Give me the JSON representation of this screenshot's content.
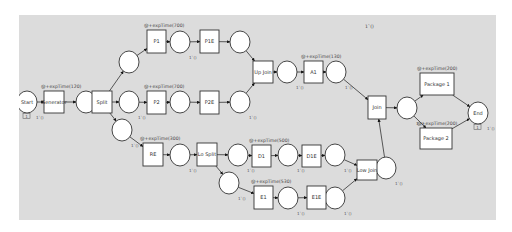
{
  "diagram": {
    "type": "petri-net",
    "canvas_color": "#dcdcdc",
    "top_marker": "1`()",
    "places": [
      {
        "id": "start",
        "label": "Start",
        "x": 27,
        "y": 102,
        "marking": "1`()",
        "token_count": "1"
      },
      {
        "id": "p_gen",
        "label": "",
        "x": 86,
        "y": 102,
        "marking": ""
      },
      {
        "id": "p_split_up",
        "label": "",
        "x": 129,
        "y": 62,
        "marking": ""
      },
      {
        "id": "p_split_mid",
        "label": "",
        "x": 129,
        "y": 102,
        "marking": "1`()"
      },
      {
        "id": "p_split_lo",
        "label": "",
        "x": 122,
        "y": 130,
        "marking": "1`()"
      },
      {
        "id": "p_p1",
        "label": "",
        "x": 180,
        "y": 42,
        "marking": "1`()"
      },
      {
        "id": "p_p1e",
        "label": "",
        "x": 240,
        "y": 42,
        "marking": ""
      },
      {
        "id": "p_p2",
        "label": "",
        "x": 180,
        "y": 102,
        "marking": ""
      },
      {
        "id": "p_p2e",
        "label": "",
        "x": 240,
        "y": 102,
        "marking": "1`()"
      },
      {
        "id": "p_upjoin",
        "label": "",
        "x": 287,
        "y": 72,
        "marking": "1`()"
      },
      {
        "id": "p_a1",
        "label": "",
        "x": 336,
        "y": 72,
        "marking": "1`()"
      },
      {
        "id": "p_re",
        "label": "",
        "x": 180,
        "y": 155,
        "marking": "1`()"
      },
      {
        "id": "p_losplit_up",
        "label": "",
        "x": 238,
        "y": 155,
        "marking": "1`()"
      },
      {
        "id": "p_losplit_lo",
        "label": "",
        "x": 229,
        "y": 183,
        "marking": "1`()"
      },
      {
        "id": "p_d1",
        "label": "",
        "x": 288,
        "y": 155,
        "marking": "1`()"
      },
      {
        "id": "p_d1e",
        "label": "",
        "x": 335,
        "y": 155,
        "marking": "1`()"
      },
      {
        "id": "p_e1",
        "label": "",
        "x": 288,
        "y": 198,
        "marking": "1`()"
      },
      {
        "id": "p_e1e",
        "label": "",
        "x": 335,
        "y": 198,
        "marking": "1`()"
      },
      {
        "id": "p_lojoin",
        "label": "",
        "x": 386,
        "y": 168,
        "marking": "1`()"
      },
      {
        "id": "p_join",
        "label": "",
        "x": 407,
        "y": 108,
        "marking": "1`()"
      },
      {
        "id": "end",
        "label": "End",
        "x": 478,
        "y": 113,
        "marking": "1`()",
        "token_count": "1"
      }
    ],
    "transitions": [
      {
        "id": "t_generator",
        "label": "Generator",
        "x": 44,
        "y": 91,
        "w": 20,
        "h": 22,
        "annotation": "@+expTime(120)"
      },
      {
        "id": "t_split",
        "label": "Split",
        "x": 92,
        "y": 91,
        "w": 20,
        "h": 22,
        "annotation": ""
      },
      {
        "id": "t_p1",
        "label": "P1",
        "x": 147,
        "y": 30,
        "w": 19,
        "h": 23,
        "annotation": "@+expTime(700)"
      },
      {
        "id": "t_p1e",
        "label": "P1E",
        "x": 200,
        "y": 30,
        "w": 19,
        "h": 23,
        "annotation": ""
      },
      {
        "id": "t_p2",
        "label": "P2",
        "x": 147,
        "y": 91,
        "w": 19,
        "h": 23,
        "annotation": "@+expTime(700)"
      },
      {
        "id": "t_p2e",
        "label": "P2E",
        "x": 200,
        "y": 91,
        "w": 19,
        "h": 23,
        "annotation": ""
      },
      {
        "id": "t_upjoin",
        "label": "Up Join",
        "x": 253,
        "y": 61,
        "w": 20,
        "h": 22,
        "annotation": ""
      },
      {
        "id": "t_a1",
        "label": "A1",
        "x": 304,
        "y": 61,
        "w": 19,
        "h": 22,
        "annotation": "@+expTime(130)"
      },
      {
        "id": "t_re",
        "label": "RE",
        "x": 143,
        "y": 143,
        "w": 20,
        "h": 23,
        "annotation": "@+expTime(300)"
      },
      {
        "id": "t_losplit",
        "label": "Lo Split",
        "x": 197,
        "y": 143,
        "w": 20,
        "h": 23,
        "annotation": ""
      },
      {
        "id": "t_d1",
        "label": "D1",
        "x": 252,
        "y": 145,
        "w": 19,
        "h": 22,
        "annotation": "@+expTime(500)"
      },
      {
        "id": "t_d1e",
        "label": "D1E",
        "x": 302,
        "y": 145,
        "w": 19,
        "h": 22,
        "annotation": ""
      },
      {
        "id": "t_e1",
        "label": "E1",
        "x": 254,
        "y": 186,
        "w": 19,
        "h": 23,
        "annotation": "@+expTime(530)"
      },
      {
        "id": "t_e1e",
        "label": "E1E",
        "x": 307,
        "y": 186,
        "w": 19,
        "h": 23,
        "annotation": ""
      },
      {
        "id": "t_lowjoin",
        "label": "Low Join",
        "x": 357,
        "y": 160,
        "w": 20,
        "h": 20,
        "annotation": ""
      },
      {
        "id": "t_join",
        "label": "Join",
        "x": 368,
        "y": 96,
        "w": 18,
        "h": 23,
        "annotation": ""
      },
      {
        "id": "t_package1",
        "label": "Package 1",
        "x": 420,
        "y": 73,
        "w": 34,
        "h": 22,
        "annotation": "@+expTime(200)"
      },
      {
        "id": "t_package2",
        "label": "Package 2",
        "x": 420,
        "y": 128,
        "w": 32,
        "h": 21,
        "annotation": "@+expTime(200)"
      }
    ],
    "arcs": [
      [
        "start",
        "t_generator"
      ],
      [
        "t_generator",
        "p_gen"
      ],
      [
        "p_gen",
        "t_split"
      ],
      [
        "t_split",
        "p_split_up"
      ],
      [
        "t_split",
        "p_split_mid"
      ],
      [
        "t_split",
        "p_split_lo"
      ],
      [
        "p_split_up",
        "t_p1"
      ],
      [
        "t_p1",
        "p_p1"
      ],
      [
        "p_p1",
        "t_p1e"
      ],
      [
        "t_p1e",
        "p_p1e"
      ],
      [
        "p_p1e",
        "t_upjoin"
      ],
      [
        "p_split_mid",
        "t_p2"
      ],
      [
        "t_p2",
        "p_p2"
      ],
      [
        "p_p2",
        "t_p2e"
      ],
      [
        "t_p2e",
        "p_p2e"
      ],
      [
        "p_p2e",
        "t_upjoin"
      ],
      [
        "t_upjoin",
        "p_upjoin"
      ],
      [
        "p_upjoin",
        "t_a1"
      ],
      [
        "t_a1",
        "p_a1"
      ],
      [
        "p_a1",
        "t_join"
      ],
      [
        "p_split_lo",
        "t_re"
      ],
      [
        "t_re",
        "p_re"
      ],
      [
        "p_re",
        "t_losplit"
      ],
      [
        "t_losplit",
        "p_losplit_up"
      ],
      [
        "t_losplit",
        "p_losplit_lo"
      ],
      [
        "p_losplit_up",
        "t_d1"
      ],
      [
        "t_d1",
        "p_d1"
      ],
      [
        "p_d1",
        "t_d1e"
      ],
      [
        "t_d1e",
        "p_d1e"
      ],
      [
        "p_d1e",
        "t_lowjoin"
      ],
      [
        "p_losplit_lo",
        "t_e1"
      ],
      [
        "t_e1",
        "p_e1"
      ],
      [
        "p_e1",
        "t_e1e"
      ],
      [
        "t_e1e",
        "p_e1e"
      ],
      [
        "p_e1e",
        "t_lowjoin"
      ],
      [
        "t_lowjoin",
        "p_lojoin"
      ],
      [
        "p_lojoin",
        "t_join"
      ],
      [
        "t_join",
        "p_join"
      ],
      [
        "p_join",
        "t_package1"
      ],
      [
        "p_join",
        "t_package2"
      ],
      [
        "t_package1",
        "end"
      ],
      [
        "t_package2",
        "end"
      ]
    ]
  }
}
